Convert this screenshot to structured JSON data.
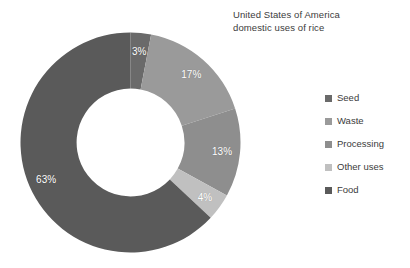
{
  "chart_data": {
    "type": "pie",
    "variant": "donut",
    "title": "United States of America domestic uses of rice",
    "title_lines": [
      "United States of America",
      "domestic uses of rice"
    ],
    "unit": "%",
    "categories": [
      "Seed",
      "Waste",
      "Processing",
      "Other uses",
      "Food"
    ],
    "values": [
      3,
      17,
      13,
      4,
      63
    ],
    "value_labels": [
      "3%",
      "17%",
      "13%",
      "4%",
      "63%"
    ],
    "colors": [
      "#6a6a6a",
      "#9a9a9a",
      "#8e8e8e",
      "#c0c0c0",
      "#5a5a5a"
    ],
    "start_angle_deg": 0,
    "direction": "clockwise",
    "inner_radius_ratio": 0.49,
    "legend_position": "right",
    "grid": false,
    "labels_inside_slices": true,
    "background": "#ffffff",
    "text_color": "#3b3b3b",
    "label_color": "#ffffff"
  },
  "title": {
    "line1": "United States of America",
    "line2": "domestic uses of rice"
  },
  "legend": {
    "items": [
      {
        "label": "Seed",
        "color": "#6a6a6a",
        "value": "3%"
      },
      {
        "label": "Waste",
        "color": "#9a9a9a",
        "value": "17%"
      },
      {
        "label": "Processing",
        "color": "#8e8e8e",
        "value": "13%"
      },
      {
        "label": "Other uses",
        "color": "#c0c0c0",
        "value": "4%"
      },
      {
        "label": "Food",
        "color": "#5a5a5a",
        "value": "63%"
      }
    ]
  }
}
